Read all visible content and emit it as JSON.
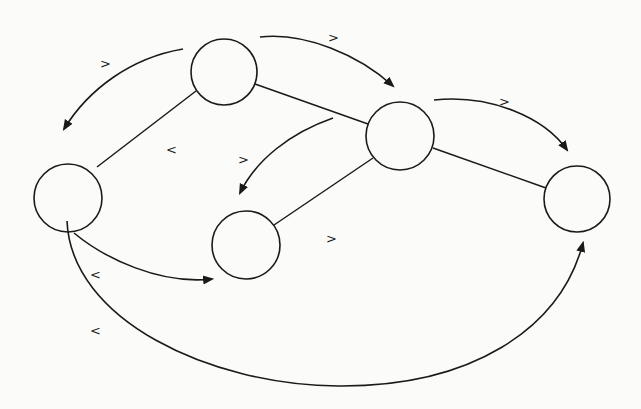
{
  "diagram": {
    "type": "graph",
    "nodes": [
      {
        "id": "A",
        "label": ""
      },
      {
        "id": "B",
        "label": ""
      },
      {
        "id": "C",
        "label": ""
      },
      {
        "id": "D",
        "label": ""
      },
      {
        "id": "E",
        "label": ""
      }
    ],
    "edges": [
      {
        "from": "A",
        "to": "C"
      },
      {
        "from": "A",
        "to": "B"
      },
      {
        "from": "B",
        "to": "D"
      },
      {
        "from": "B",
        "to": "E"
      }
    ],
    "arrows": [
      {
        "from": "A",
        "to": "C",
        "label": ">"
      },
      {
        "from": "A",
        "to": "B",
        "label": ">"
      },
      {
        "from": "B",
        "to": "D",
        "label": ">"
      },
      {
        "from": "B",
        "to": "E",
        "label": ">"
      },
      {
        "from": "C",
        "to": "D",
        "label": "<"
      },
      {
        "from": "C",
        "to": "E",
        "label": "<"
      }
    ],
    "free_labels": [
      {
        "near": "edge-A-C",
        "label": "<"
      },
      {
        "near": "edge-B-D",
        "label": ">"
      }
    ],
    "colors": {
      "ink": "#1a1a1a",
      "background": "#fbfbf9"
    }
  }
}
